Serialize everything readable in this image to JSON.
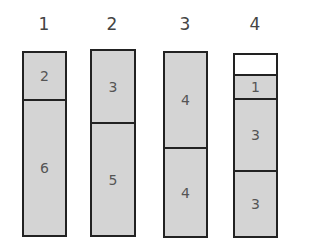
{
  "diagram": {
    "type": "bin-packing",
    "colors": {
      "filled": "#d4d4d4",
      "empty": "#ffffff",
      "border": "#222222"
    },
    "bins": [
      {
        "label": "1",
        "items": [
          {
            "value": "2"
          },
          {
            "value": "6"
          }
        ]
      },
      {
        "label": "2",
        "items": [
          {
            "value": "3"
          },
          {
            "value": "5"
          }
        ]
      },
      {
        "label": "3",
        "items": [
          {
            "value": "4"
          },
          {
            "value": "4"
          }
        ]
      },
      {
        "label": "4",
        "items": [
          {
            "value": "",
            "empty": true
          },
          {
            "value": "1"
          },
          {
            "value": "3"
          },
          {
            "value": "3"
          }
        ]
      }
    ]
  }
}
